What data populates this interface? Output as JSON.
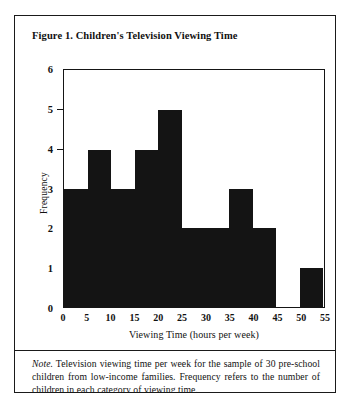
{
  "figure": {
    "title": "Figure 1. Children's Television Viewing Time",
    "note_lead": "Note.",
    "note_body": " Television viewing time per week for the sample of 30 pre-school children from low-income families.  Frequency refers to the number of children in each category of viewing time."
  },
  "chart_data": {
    "type": "bar",
    "title": "Figure 1. Children's Television Viewing Time",
    "xlabel": "Viewing Time (hours per week)",
    "ylabel": "Frequency",
    "categories": [
      "0-5",
      "5-10",
      "10-15",
      "15-20",
      "20-25",
      "25-30",
      "30-35",
      "35-40",
      "40-45",
      "45-50",
      "50-55"
    ],
    "values": [
      3,
      4,
      3,
      4,
      5,
      2,
      2,
      3,
      2,
      0,
      1
    ],
    "bin_edges": [
      0,
      5,
      10,
      15,
      20,
      25,
      30,
      35,
      40,
      45,
      50,
      55
    ],
    "xticklabels": [
      "0",
      "5",
      "10",
      "15",
      "20",
      "25",
      "30",
      "35",
      "40",
      "45",
      "50",
      "55"
    ],
    "yticklabels": [
      "0",
      "1",
      "2",
      "3",
      "4",
      "5",
      "6"
    ],
    "xlim": [
      0,
      55
    ],
    "ylim": [
      0,
      6
    ],
    "grid": false,
    "legend": false,
    "bar_color": "#141414"
  }
}
